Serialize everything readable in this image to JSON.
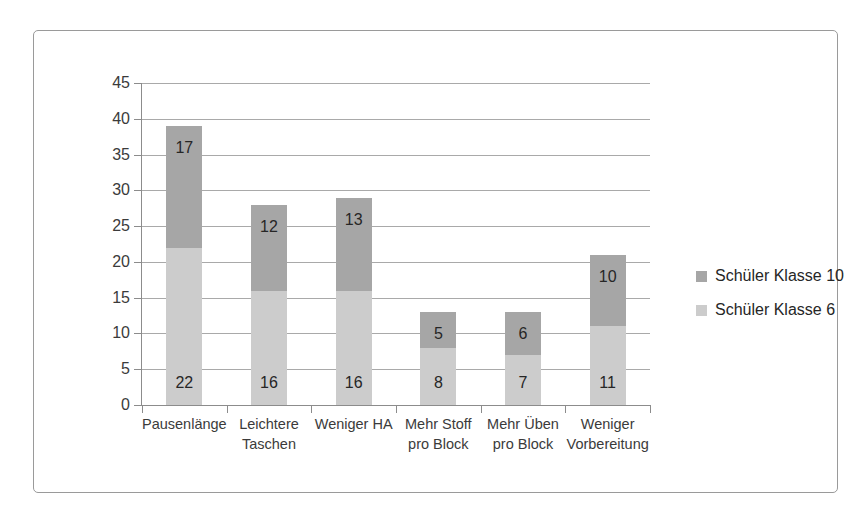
{
  "chart_data": {
    "type": "bar",
    "subtype": "stacked-bar",
    "title": "",
    "xlabel": "",
    "ylabel": "",
    "ylim": [
      0,
      45
    ],
    "ytick_step": 5,
    "yticks": [
      45,
      40,
      35,
      30,
      25,
      20,
      15,
      10,
      5,
      0
    ],
    "ytick_labels": [
      "45",
      "40",
      "35",
      "30",
      "25",
      "20",
      "15",
      "10",
      "5",
      "0"
    ],
    "grid": true,
    "grid_axis": "y",
    "legend_position": "right",
    "categories": [
      "Pausenlänge",
      "Leichtere Taschen",
      "Weniger HA",
      "Mehr Stoff pro Block",
      "Mehr Üben pro Block",
      "Weniger Vorbereitung"
    ],
    "category_lines": [
      [
        "Pausenlänge"
      ],
      [
        "Leichtere",
        "Taschen"
      ],
      [
        "Weniger HA"
      ],
      [
        "Mehr Stoff",
        "pro Block"
      ],
      [
        "Mehr Üben",
        "pro Block"
      ],
      [
        "Weniger",
        "Vorbereitung"
      ]
    ],
    "series": [
      {
        "name": "Schüler Klasse 6",
        "color": "#cccccc",
        "stack_position": "bottom",
        "values": [
          22,
          16,
          16,
          8,
          7,
          11
        ]
      },
      {
        "name": "Schüler Klasse 10",
        "color": "#a6a6a6",
        "stack_position": "top",
        "values": [
          17,
          12,
          13,
          5,
          6,
          10
        ]
      }
    ],
    "totals": [
      39,
      28,
      29,
      13,
      13,
      21
    ],
    "data_labels_shown": true
  },
  "legend": {
    "items": [
      {
        "label": "Schüler Klasse 10",
        "color": "#a6a6a6"
      },
      {
        "label": "Schüler Klasse 6",
        "color": "#cccccc"
      }
    ]
  },
  "style": {
    "bar_dark": "#a6a6a6",
    "bar_light": "#cccccc",
    "grid_color": "#a9a9a9",
    "axis_color": "#8c8c8c",
    "frame_color": "#9a9a9a",
    "text_color": "#3b3b3b",
    "label_color": "#262626",
    "background": "#ffffff"
  }
}
